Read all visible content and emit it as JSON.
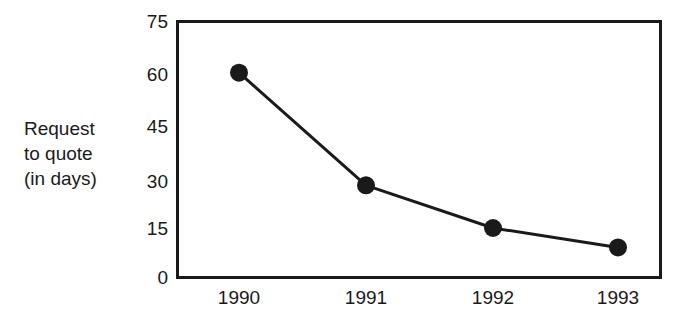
{
  "chart_data": {
    "type": "line",
    "title": "",
    "subtitle": "",
    "xlabel": "",
    "ylabel": "Request to quote (in days)",
    "ylabel_lines": [
      "Request",
      "to quote",
      "(in days)"
    ],
    "categories": [
      "1990",
      "1991",
      "1992",
      "1993"
    ],
    "x": [
      1990,
      1991,
      1992,
      1993
    ],
    "values": [
      60,
      27,
      14.5,
      8.8
    ],
    "series": [
      {
        "name": "Request to quote (in days)",
        "values": [
          60,
          27,
          14.5,
          8.8
        ]
      }
    ],
    "yticks": [
      75,
      60,
      45,
      30,
      15,
      0
    ],
    "ylim": [
      0,
      75
    ],
    "xticklabels": [
      "1990",
      "1991",
      "1992",
      "1993"
    ],
    "grid": false,
    "legend": "none",
    "marker": "filled-circle",
    "line_color": "#1a1a1a",
    "marker_color": "#1a1a1a",
    "frame_color": "#1a1a1a",
    "background_color": "#ffffff"
  },
  "axis": {
    "y_tick_labels": [
      "75",
      "60",
      "45",
      "30",
      "15",
      "0"
    ],
    "x_tick_labels": [
      "1990",
      "1991",
      "1992",
      "1993"
    ]
  }
}
